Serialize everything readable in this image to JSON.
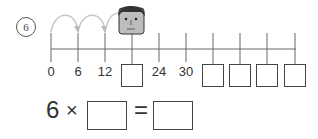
{
  "problem": {
    "number": "6",
    "number_line": {
      "step": 6,
      "labels": [
        "0",
        "6",
        "12",
        "",
        "24",
        "30",
        "",
        "",
        "",
        ""
      ],
      "blank_positions": [
        3,
        6,
        7,
        8,
        9
      ]
    },
    "equation": {
      "left_operand": "6",
      "times_sign": "×",
      "equals_sign": "="
    },
    "character": "boy-face"
  }
}
